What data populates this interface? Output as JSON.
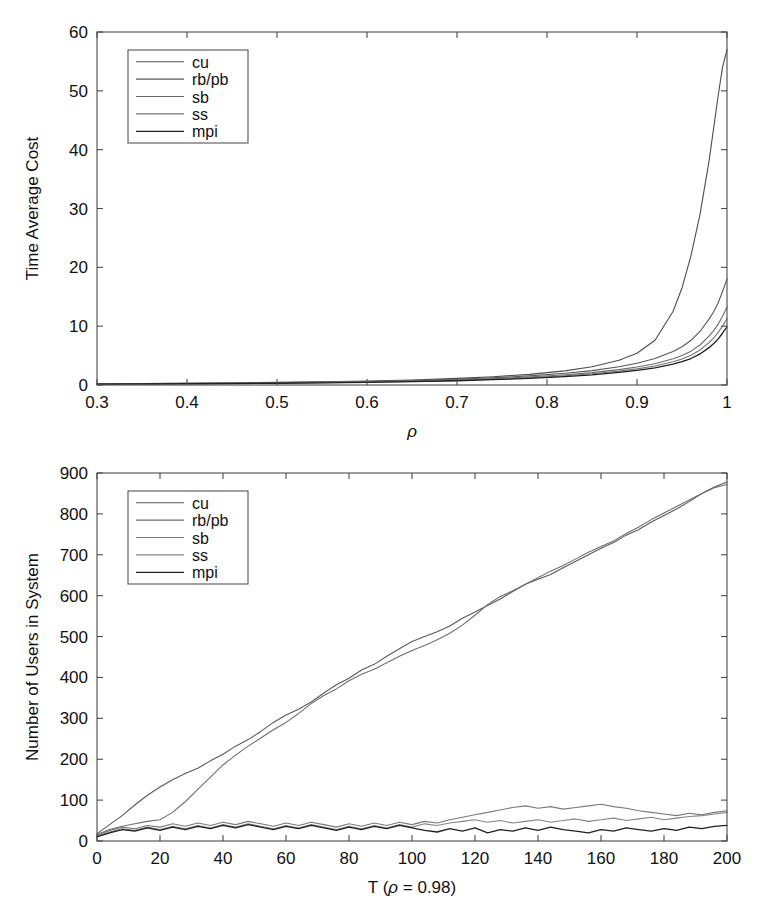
{
  "figure": {
    "background": "#ffffff",
    "ink": "#333333"
  },
  "chart_data": [
    {
      "id": "time-average-cost",
      "type": "line",
      "title": "",
      "xlabel": "ρ",
      "xlabel_style": "italic",
      "ylabel": "Time Average Cost",
      "xlim": [
        0.3,
        1.0
      ],
      "ylim": [
        0,
        60
      ],
      "xticks": [
        0.3,
        0.4,
        0.5,
        0.6,
        0.7,
        0.8,
        0.9,
        1.0
      ],
      "xticklabels": [
        "0.3",
        "0.4",
        "0.5",
        "0.6",
        "0.7",
        "0.8",
        "0.9",
        "1"
      ],
      "yticks": [
        0,
        10,
        20,
        30,
        40,
        50,
        60
      ],
      "yticklabels": [
        "0",
        "10",
        "20",
        "30",
        "40",
        "50",
        "60"
      ],
      "grid": false,
      "legend_position": "top-left",
      "legend": [
        "cu",
        "rb/pb",
        "sb",
        "ss",
        "mpi"
      ],
      "x": [
        0.3,
        0.35,
        0.4,
        0.45,
        0.5,
        0.55,
        0.6,
        0.65,
        0.7,
        0.74,
        0.78,
        0.82,
        0.85,
        0.88,
        0.9,
        0.92,
        0.94,
        0.95,
        0.96,
        0.97,
        0.98,
        0.985,
        0.99,
        0.995,
        1.0
      ],
      "series": [
        {
          "name": "cu",
          "color": "#4d4d4d",
          "width": 1.1,
          "values": [
            0.22,
            0.26,
            0.3,
            0.36,
            0.44,
            0.54,
            0.68,
            0.86,
            1.12,
            1.4,
            1.8,
            2.4,
            3.1,
            4.2,
            5.4,
            7.6,
            12.5,
            16.5,
            22.0,
            29.0,
            38.0,
            43.5,
            49.0,
            54.0,
            57.0
          ]
        },
        {
          "name": "rb/pb",
          "color": "#585858",
          "width": 1.1,
          "values": [
            0.2,
            0.24,
            0.28,
            0.33,
            0.4,
            0.49,
            0.6,
            0.76,
            0.98,
            1.22,
            1.55,
            2.0,
            2.45,
            3.1,
            3.7,
            4.5,
            5.7,
            6.5,
            7.6,
            9.1,
            11.2,
            12.4,
            13.9,
            15.9,
            18.0
          ]
        },
        {
          "name": "sb",
          "color": "#6a6a6a",
          "width": 1.1,
          "values": [
            0.18,
            0.21,
            0.25,
            0.3,
            0.36,
            0.44,
            0.54,
            0.68,
            0.87,
            1.08,
            1.36,
            1.74,
            2.1,
            2.62,
            3.05,
            3.6,
            4.45,
            5.0,
            5.75,
            6.8,
            8.3,
            9.2,
            10.3,
            11.7,
            13.2
          ]
        },
        {
          "name": "ss",
          "color": "#757575",
          "width": 1.1,
          "values": [
            0.16,
            0.19,
            0.23,
            0.27,
            0.33,
            0.4,
            0.49,
            0.62,
            0.79,
            0.98,
            1.24,
            1.58,
            1.9,
            2.36,
            2.74,
            3.22,
            3.95,
            4.42,
            5.05,
            5.95,
            7.2,
            7.95,
            8.9,
            10.0,
            11.3
          ]
        },
        {
          "name": "mpi",
          "color": "#1f1f1f",
          "width": 1.3,
          "values": [
            0.15,
            0.18,
            0.21,
            0.25,
            0.3,
            0.37,
            0.45,
            0.57,
            0.72,
            0.9,
            1.13,
            1.44,
            1.73,
            2.14,
            2.48,
            2.9,
            3.55,
            3.96,
            4.5,
            5.28,
            6.35,
            7.0,
            7.8,
            8.8,
            9.9
          ]
        }
      ]
    },
    {
      "id": "number-of-users-in-system",
      "type": "line",
      "title": "",
      "xlabel": "T (ρ = 0.98)",
      "ylabel": "Number of Users in System",
      "xlim": [
        0,
        200
      ],
      "ylim": [
        0,
        900
      ],
      "xticks": [
        0,
        20,
        40,
        60,
        80,
        100,
        120,
        140,
        160,
        180,
        200
      ],
      "xticklabels": [
        "0",
        "20",
        "40",
        "60",
        "80",
        "100",
        "120",
        "140",
        "160",
        "180",
        "200"
      ],
      "yticks": [
        0,
        100,
        200,
        300,
        400,
        500,
        600,
        700,
        800,
        900
      ],
      "yticklabels": [
        "0",
        "100",
        "200",
        "300",
        "400",
        "500",
        "600",
        "700",
        "800",
        "900"
      ],
      "grid": false,
      "legend_position": "top-left",
      "legend": [
        "cu",
        "rb/pb",
        "sb",
        "ss",
        "mpi"
      ],
      "x": [
        0,
        4,
        8,
        12,
        16,
        20,
        24,
        28,
        32,
        36,
        40,
        44,
        48,
        52,
        56,
        60,
        64,
        68,
        72,
        76,
        80,
        84,
        88,
        92,
        96,
        100,
        104,
        108,
        112,
        116,
        120,
        124,
        128,
        132,
        136,
        140,
        144,
        148,
        152,
        156,
        160,
        164,
        168,
        172,
        176,
        180,
        184,
        188,
        192,
        196,
        200
      ],
      "series": [
        {
          "name": "cu",
          "color": "#5a5a5a",
          "width": 1.1,
          "values": [
            18,
            40,
            62,
            88,
            112,
            132,
            150,
            165,
            178,
            196,
            212,
            232,
            248,
            268,
            290,
            308,
            322,
            340,
            362,
            382,
            398,
            418,
            432,
            452,
            470,
            488,
            500,
            512,
            526,
            545,
            560,
            576,
            592,
            610,
            628,
            640,
            652,
            668,
            684,
            700,
            716,
            730,
            748,
            762,
            780,
            796,
            812,
            830,
            850,
            866,
            878
          ]
        },
        {
          "name": "rb/pb",
          "color": "#6e6e6e",
          "width": 1.1,
          "values": [
            16,
            28,
            36,
            42,
            48,
            52,
            70,
            96,
            126,
            156,
            186,
            210,
            232,
            252,
            272,
            290,
            312,
            336,
            356,
            372,
            392,
            408,
            420,
            436,
            452,
            466,
            478,
            492,
            508,
            528,
            552,
            578,
            598,
            612,
            628,
            644,
            660,
            674,
            690,
            706,
            720,
            734,
            752,
            768,
            786,
            802,
            818,
            834,
            850,
            864,
            872
          ]
        },
        {
          "name": "sb",
          "color": "#7a7a7a",
          "width": 1.1,
          "values": [
            14,
            26,
            34,
            30,
            38,
            34,
            42,
            36,
            44,
            38,
            46,
            40,
            48,
            42,
            36,
            44,
            38,
            46,
            40,
            34,
            42,
            36,
            44,
            38,
            46,
            40,
            48,
            44,
            52,
            58,
            64,
            70,
            76,
            82,
            86,
            80,
            84,
            78,
            82,
            86,
            90,
            84,
            80,
            74,
            70,
            66,
            62,
            68,
            64,
            70,
            74
          ]
        },
        {
          "name": "ss",
          "color": "#858585",
          "width": 1.1,
          "values": [
            12,
            22,
            30,
            26,
            34,
            28,
            36,
            30,
            38,
            32,
            40,
            34,
            42,
            36,
            30,
            38,
            32,
            40,
            34,
            28,
            36,
            30,
            38,
            32,
            40,
            34,
            42,
            38,
            44,
            48,
            52,
            46,
            50,
            44,
            48,
            52,
            46,
            50,
            54,
            48,
            52,
            56,
            50,
            54,
            58,
            52,
            56,
            60,
            62,
            66,
            70
          ]
        },
        {
          "name": "mpi",
          "color": "#202020",
          "width": 1.3,
          "values": [
            10,
            20,
            28,
            24,
            32,
            26,
            34,
            28,
            36,
            30,
            38,
            32,
            40,
            34,
            28,
            36,
            30,
            38,
            32,
            26,
            34,
            28,
            36,
            30,
            38,
            32,
            26,
            22,
            30,
            24,
            32,
            20,
            28,
            24,
            32,
            26,
            34,
            28,
            24,
            20,
            28,
            24,
            32,
            28,
            24,
            30,
            26,
            34,
            30,
            36,
            38
          ]
        }
      ]
    }
  ]
}
